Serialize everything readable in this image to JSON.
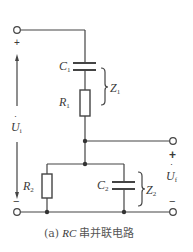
{
  "diagram": {
    "type": "circuit",
    "caption": {
      "prefix": "(a)",
      "italic": "RC",
      "text": "串并联电路"
    },
    "components": {
      "C1": {
        "symbol": "C",
        "sub": "1",
        "kind": "capacitor"
      },
      "R1": {
        "symbol": "R",
        "sub": "1",
        "kind": "resistor"
      },
      "R2": {
        "symbol": "R",
        "sub": "2",
        "kind": "resistor"
      },
      "C2": {
        "symbol": "C",
        "sub": "2",
        "kind": "capacitor"
      }
    },
    "impedances": {
      "Z1": {
        "symbol": "Z",
        "sub": "1",
        "groups": [
          "C1",
          "R1"
        ],
        "connection": "series"
      },
      "Z2": {
        "symbol": "Z",
        "sub": "2",
        "groups": [
          "R2",
          "C2"
        ],
        "connection": "parallel"
      }
    },
    "input_voltage": {
      "symbol": "U",
      "sub": "i",
      "dot": "·",
      "plus": "+",
      "minus": "−"
    },
    "output_voltage": {
      "symbol": "U",
      "sub": "f",
      "dot": "·",
      "plus": "+",
      "minus": "−"
    },
    "colors": {
      "line": "#444444",
      "text": "#3a3a3a",
      "background": "#ffffff"
    }
  }
}
